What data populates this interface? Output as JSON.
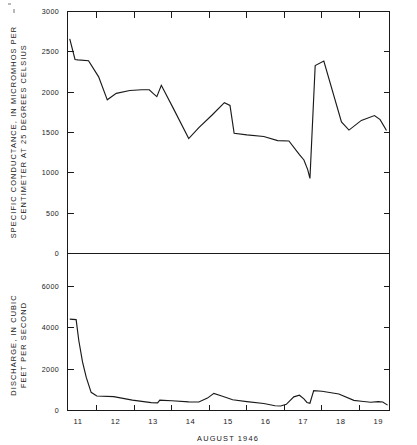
{
  "figure": {
    "background_color": "#ffffff",
    "line_color": "#1a1a1a",
    "xaxis_title": "AUGUST 1946",
    "x_tick_labels": [
      "11",
      "12",
      "13",
      "14",
      "15",
      "16",
      "17",
      "18",
      "19"
    ]
  },
  "upper_panel": {
    "ylabel_line1": "SPECIFIC CONDUCTANCE, IN MICROMHOS PER",
    "ylabel_line2": "CENTIMETER AT 25 DEGREES CELSIUS",
    "y_tick_labels": [
      "3000",
      "2500",
      "2000",
      "1500",
      "1000",
      "500",
      "0"
    ]
  },
  "lower_panel": {
    "ylabel_line1": "DISCHARGE, IN CUBIC",
    "ylabel_line2": "FEET PER SECOND",
    "y_tick_labels": [
      "6000",
      "4000",
      "2000",
      "0"
    ]
  },
  "chart_data": [
    {
      "type": "line",
      "title": "",
      "panel": "upper",
      "xlabel": "AUGUST 1946",
      "ylabel": "SPECIFIC CONDUCTANCE, IN MICROMHOS PER CENTIMETER AT 25 DEGREES CELSIUS",
      "xlim": [
        10.72,
        19.3
      ],
      "ylim": [
        0,
        3000
      ],
      "yticks": [
        0,
        500,
        1000,
        1500,
        2000,
        2500,
        3000
      ],
      "xticks": [
        11.5,
        12.5,
        13.5,
        14.5,
        15.5,
        16.5,
        17.5,
        18.5
      ],
      "xticklabels_at": [
        11,
        12,
        13,
        14,
        15,
        16,
        17,
        18,
        19
      ],
      "grid": false,
      "legend": "none",
      "x": [
        10.78,
        10.92,
        11.0,
        11.28,
        11.55,
        11.78,
        12.02,
        12.38,
        12.7,
        12.9,
        13.0,
        13.1,
        13.22,
        13.55,
        13.95,
        14.22,
        14.58,
        14.9,
        15.05,
        15.16,
        15.5,
        15.95,
        16.32,
        16.62,
        16.9,
        17.02,
        17.12,
        17.18,
        17.32,
        17.55,
        18.02,
        18.22,
        18.55,
        18.9,
        19.05,
        19.22
      ],
      "y": [
        2660,
        2405,
        2400,
        2390,
        2190,
        1905,
        1985,
        2020,
        2030,
        2030,
        1985,
        1945,
        2085,
        1790,
        1425,
        1560,
        1720,
        1870,
        1835,
        1490,
        1470,
        1450,
        1400,
        1395,
        1225,
        1160,
        1040,
        930,
        2330,
        2385,
        1630,
        1530,
        1650,
        1710,
        1660,
        1525
      ]
    },
    {
      "type": "line",
      "title": "",
      "panel": "lower",
      "xlabel": "AUGUST 1946",
      "ylabel": "DISCHARGE, IN CUBIC FEET PER SECOND",
      "xlim": [
        10.72,
        19.3
      ],
      "ylim": [
        0,
        7600
      ],
      "yticks": [
        0,
        2000,
        4000,
        6000
      ],
      "xticks": [
        11.5,
        12.5,
        13.5,
        14.5,
        15.5,
        16.5,
        17.5,
        18.5
      ],
      "xticklabels_at": [
        11,
        12,
        13,
        14,
        15,
        16,
        17,
        18,
        19
      ],
      "grid": false,
      "legend": "none",
      "x": [
        10.78,
        10.95,
        11.02,
        11.12,
        11.22,
        11.35,
        11.5,
        11.95,
        12.45,
        12.95,
        13.12,
        13.18,
        13.28,
        13.5,
        13.95,
        14.22,
        14.45,
        14.62,
        14.85,
        15.12,
        15.5,
        15.95,
        16.25,
        16.4,
        16.55,
        16.75,
        16.9,
        17.02,
        17.1,
        17.18,
        17.28,
        17.5,
        17.95,
        18.35,
        18.55,
        18.8,
        19.0,
        19.12,
        19.25
      ],
      "y": [
        4420,
        4400,
        3400,
        2350,
        1600,
        880,
        700,
        670,
        500,
        380,
        370,
        500,
        490,
        470,
        420,
        410,
        600,
        830,
        690,
        520,
        430,
        340,
        230,
        220,
        300,
        660,
        740,
        560,
        390,
        350,
        960,
        930,
        800,
        490,
        450,
        400,
        430,
        410,
        260
      ]
    }
  ]
}
